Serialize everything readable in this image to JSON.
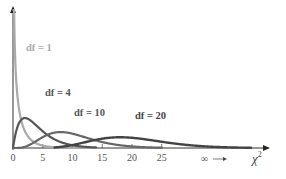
{
  "chart_data": {
    "type": "line",
    "title": "",
    "xlabel": "χ²",
    "ylabel": "",
    "xlim": [
      0,
      42
    ],
    "x_ticks": [
      0,
      5,
      10,
      15,
      20,
      25
    ],
    "x_tick_labels": [
      "0",
      "5",
      "10",
      "15",
      "20",
      "25"
    ],
    "infinity_annotation": "∞ →",
    "grid": false,
    "legend": "inline labels",
    "series": [
      {
        "name": "df = 1",
        "df": 1,
        "color": "#aaaaaa",
        "x_range": [
          0.05,
          14
        ]
      },
      {
        "name": "df = 4",
        "df": 4,
        "color": "#555555",
        "x_range": [
          0,
          14
        ]
      },
      {
        "name": "df = 10",
        "df": 10,
        "color": "#666666",
        "x_range": [
          0,
          25
        ]
      },
      {
        "name": "df = 20",
        "df": 20,
        "color": "#444444",
        "x_range": [
          7,
          40
        ]
      }
    ]
  },
  "labels": {
    "df1": "df = 1",
    "df4": "df = 4",
    "df10": "df = 10",
    "df20": "df = 20",
    "ticks": [
      "0",
      "5",
      "10",
      "15",
      "20",
      "25"
    ],
    "infinity": "∞",
    "xaxis_symbol": "χ",
    "xaxis_sup": "2"
  }
}
